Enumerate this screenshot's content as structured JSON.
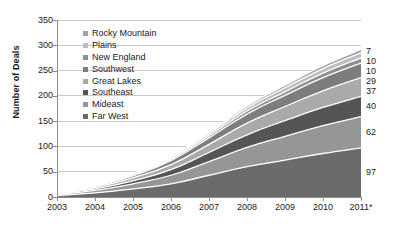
{
  "chart_data": {
    "type": "area",
    "stacked": true,
    "title": "",
    "xlabel": "",
    "ylabel": "Number of Deals",
    "categories": [
      "2003",
      "2004",
      "2005",
      "2006",
      "2007",
      "2008",
      "2009",
      "2010",
      "2011*"
    ],
    "ylim": [
      0,
      350
    ],
    "yticks": [
      0,
      50,
      100,
      150,
      200,
      250,
      300,
      350
    ],
    "grid": true,
    "grid_axis": "y",
    "legend_position": "upper-left-inside",
    "series": [
      {
        "name": "Far West",
        "color": "#6b6b6b",
        "values": [
          3,
          8,
          16,
          26,
          43,
          60,
          73,
          86,
          97
        ],
        "end_label": "97"
      },
      {
        "name": "Mideast",
        "color": "#969696",
        "values": [
          2,
          5,
          10,
          17,
          27,
          38,
          47,
          55,
          62
        ],
        "end_label": "62"
      },
      {
        "name": "Southeast",
        "color": "#555555",
        "values": [
          1,
          3,
          6,
          11,
          18,
          25,
          31,
          36,
          40
        ],
        "end_label": "40"
      },
      {
        "name": "Great Lakes",
        "color": "#aaaaaa",
        "values": [
          1,
          3,
          6,
          10,
          16,
          23,
          28,
          33,
          37
        ],
        "end_label": "37"
      },
      {
        "name": "Southwest",
        "color": "#7d7d7d",
        "values": [
          1,
          2,
          4,
          8,
          13,
          18,
          22,
          26,
          29
        ],
        "end_label": "29"
      },
      {
        "name": "New England",
        "color": "#8f8f8f",
        "values": [
          0,
          1,
          2,
          3,
          4,
          6,
          7,
          9,
          10
        ],
        "end_label": "10"
      },
      {
        "name": "Plains",
        "color": "#bdbdbd",
        "values": [
          0,
          1,
          2,
          3,
          4,
          6,
          8,
          9,
          10
        ],
        "end_label": "10"
      },
      {
        "name": "Rocky Mountain",
        "color": "#a3a3a3",
        "values": [
          0,
          0,
          1,
          2,
          3,
          4,
          5,
          6,
          7
        ],
        "end_label": "7"
      }
    ],
    "totals": [
      8,
      23,
      47,
      80,
      128,
      180,
      221,
      260,
      292
    ],
    "end_labels_top_to_bottom": [
      "7",
      "10",
      "10",
      "29",
      "37",
      "40",
      "62",
      "97"
    ]
  },
  "legend": {
    "items": [
      {
        "label": "Rocky Mountain",
        "color": "#a3a3a3"
      },
      {
        "label": "Plains",
        "color": "#bdbdbd"
      },
      {
        "label": "New England",
        "color": "#8f8f8f"
      },
      {
        "label": "Southwest",
        "color": "#7d7d7d"
      },
      {
        "label": "Great Lakes",
        "color": "#aaaaaa"
      },
      {
        "label": "Southeast",
        "color": "#555555"
      },
      {
        "label": "Mideast",
        "color": "#969696"
      },
      {
        "label": "Far West",
        "color": "#6b6b6b"
      }
    ]
  },
  "axis": {
    "y_title": "Number of Deals",
    "y_tick_labels": [
      "350",
      "300",
      "250",
      "200",
      "150",
      "100",
      "50",
      "0"
    ],
    "x_tick_labels": [
      "2003",
      "2004",
      "2005",
      "2006",
      "2007",
      "2008",
      "2009",
      "2010",
      "2011*"
    ]
  },
  "colors": {
    "axis_line": "#8d8d8d",
    "grid_line": "#c9c9c9",
    "text": "#1a1a1a",
    "separator": "#ffffff"
  }
}
